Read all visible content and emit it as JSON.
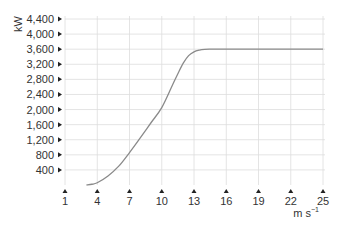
{
  "chart_data": {
    "type": "line",
    "title": "",
    "xlabel": "m s⁻¹",
    "ylabel": "kW",
    "xlim": [
      1,
      25
    ],
    "ylim": [
      0,
      4400
    ],
    "grid": true,
    "legend": null,
    "x_ticks": [
      1,
      4,
      7,
      10,
      13,
      16,
      19,
      22,
      25
    ],
    "x_tick_labels": [
      "1",
      "4",
      "7",
      "10",
      "13",
      "16",
      "19",
      "22",
      "25"
    ],
    "y_ticks": [
      400,
      800,
      1200,
      1600,
      2000,
      2400,
      2800,
      3200,
      3600,
      4000,
      4400
    ],
    "y_tick_labels": [
      "400",
      "800",
      "1,200",
      "1,600",
      "2,000",
      "2,400",
      "2,800",
      "3,200",
      "3,600",
      "4,000",
      "4,400"
    ],
    "series": [
      {
        "name": "Power curve",
        "color": "#8a8a8a",
        "x": [
          3,
          3.5,
          4,
          5,
          6,
          7,
          8,
          9,
          10,
          11,
          11.5,
          12,
          12.5,
          13,
          13.5,
          14,
          14.5,
          15,
          16,
          19,
          22,
          25
        ],
        "values": [
          0,
          20,
          60,
          240,
          500,
          860,
          1250,
          1650,
          2050,
          2650,
          2950,
          3230,
          3430,
          3530,
          3575,
          3595,
          3600,
          3600,
          3600,
          3600,
          3600,
          3600
        ]
      }
    ]
  },
  "axis": {
    "y_unit": "kW",
    "x_unit_base": "m s",
    "x_unit_exp": "−1"
  },
  "colors": {
    "grid": "#dddddd",
    "curve": "#8a8a8a",
    "text": "#333333",
    "tick_marker": "#222222"
  }
}
